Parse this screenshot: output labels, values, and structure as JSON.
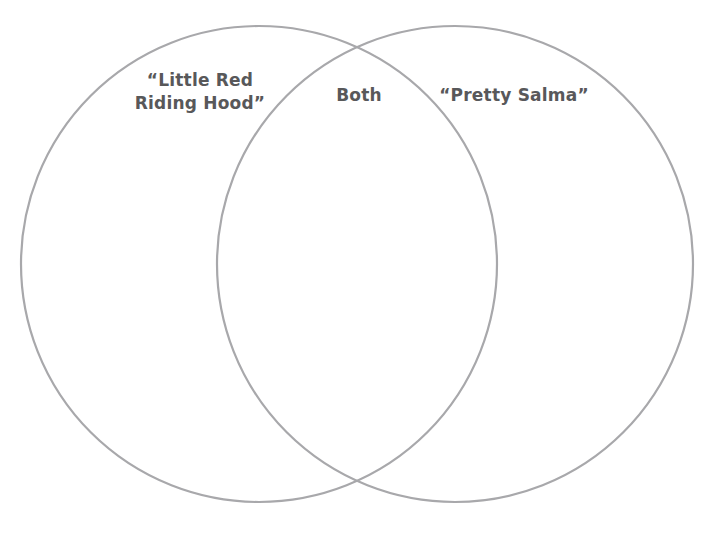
{
  "canvas": {
    "width": 715,
    "height": 538,
    "background_color": "#ffffff"
  },
  "diagram": {
    "type": "venn-two-set",
    "stroke_color": "#a8a8ab",
    "stroke_width": 2.2,
    "text_color": "#58585a",
    "left_circle": {
      "cx": 259,
      "cy": 264,
      "r": 238
    },
    "right_circle": {
      "cx": 455,
      "cy": 264,
      "r": 238
    }
  },
  "labels": {
    "left": "“Little Red\nRiding Hood”",
    "both": "Both",
    "right": "“Pretty Salma”"
  },
  "chart_data": {
    "type": "venn",
    "title": "",
    "sets": [
      {
        "name": "“Little Red Riding Hood”",
        "label": "“Little Red\nRiding Hood”",
        "items": []
      },
      {
        "name": "“Pretty Salma”",
        "label": "“Pretty Salma”",
        "items": []
      }
    ],
    "intersection": {
      "label": "Both",
      "items": []
    },
    "legend": "none",
    "grid": false
  }
}
